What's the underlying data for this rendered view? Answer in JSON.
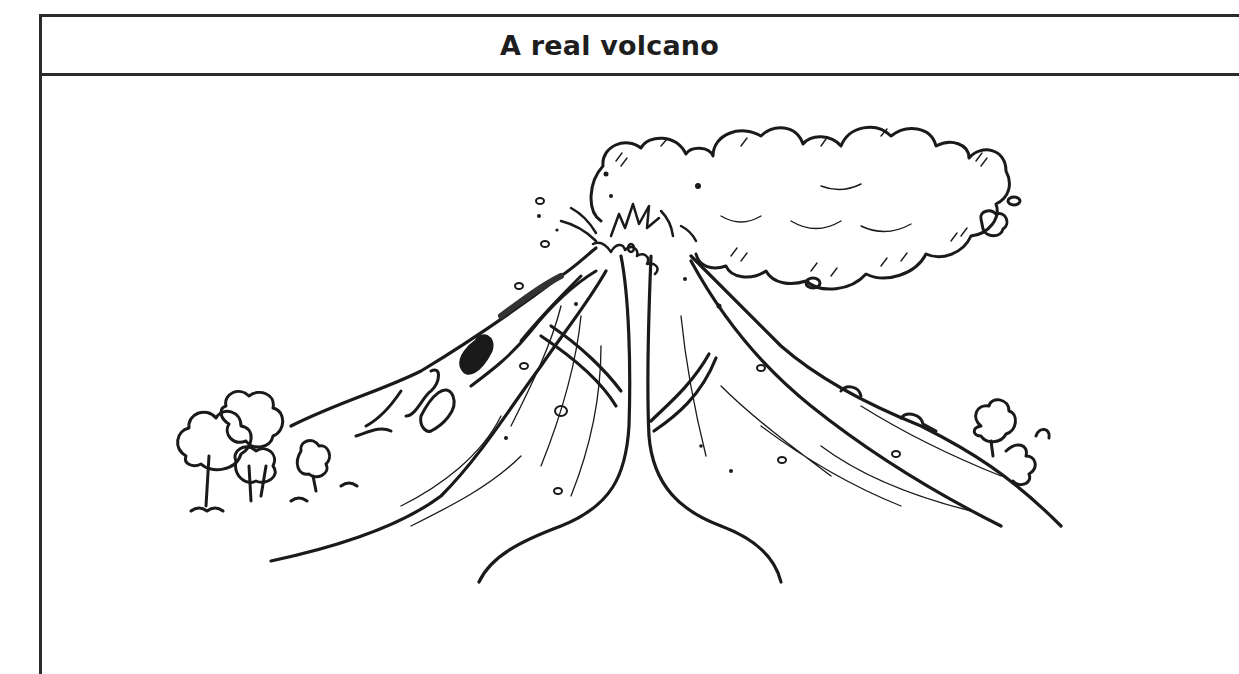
{
  "worksheet": {
    "title": "A real volcano",
    "border_color": "#2b2b2b",
    "illustration": {
      "subject": "volcano-erupting-illustration",
      "description": "Black and white line drawing of an erupting volcano with ash cloud, lava flows down the left slope, and trees at the base on both sides",
      "elements": [
        "ash-cloud",
        "crater-eruption",
        "lava-flow",
        "volcano-slopes",
        "magma-vent",
        "trees-left",
        "trees-right"
      ]
    }
  }
}
